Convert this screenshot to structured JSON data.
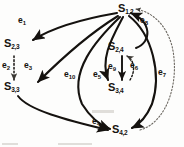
{
  "figure": {
    "type": "directed-graph",
    "caption": "",
    "width": 184,
    "height": 147,
    "background_color": "#fdfdfc",
    "ink_color": "#15120f"
  },
  "nodes": [
    {
      "id": "S12",
      "base": "S",
      "subscript": "1,2",
      "label": "S1,2",
      "x": 122,
      "y": 9
    },
    {
      "id": "S23",
      "base": "S",
      "subscript": "2,3",
      "label": "S2,3",
      "x": 6,
      "y": 44
    },
    {
      "id": "S33",
      "base": "S",
      "subscript": "3,3",
      "label": "S3,3",
      "x": 6,
      "y": 87
    },
    {
      "id": "S24",
      "base": "S",
      "subscript": "2,4",
      "label": "S2,4",
      "x": 110,
      "y": 46
    },
    {
      "id": "S34",
      "base": "S",
      "subscript": "3,4",
      "label": "S3,4",
      "x": 110,
      "y": 88
    },
    {
      "id": "S42",
      "base": "S",
      "subscript": "4,2",
      "label": "S4,2",
      "x": 114,
      "y": 125
    }
  ],
  "edges": [
    {
      "id": "e1",
      "base": "e",
      "subscript": "1",
      "label": "e1",
      "from": "S12",
      "to": "S23",
      "style": "solid",
      "label_x": 20,
      "label_y": 22
    },
    {
      "id": "e2",
      "base": "e",
      "subscript": "2",
      "label": "e2",
      "from": "S23",
      "to": "S33",
      "style": "dotted",
      "label_x": 3,
      "label_y": 65
    },
    {
      "id": "e3",
      "base": "e",
      "subscript": "3",
      "label": "e3",
      "from": "S12",
      "to": "S33",
      "style": "solid",
      "label_x": 25,
      "label_y": 64
    },
    {
      "id": "e4",
      "base": "e",
      "subscript": "4",
      "label": "e4",
      "from": "S33",
      "to": "S42",
      "style": "solid",
      "label_x": 93,
      "label_y": 121
    },
    {
      "id": "e5",
      "base": "e",
      "subscript": "5",
      "label": "e5",
      "from": "S12",
      "to": "S34",
      "style": "solid",
      "label_x": 94,
      "label_y": 74
    },
    {
      "id": "e6",
      "base": "e",
      "subscript": "6",
      "label": "e6",
      "from": "S34",
      "to": "S24",
      "style": "dotted",
      "label_x": 131,
      "label_y": 65
    },
    {
      "id": "e7",
      "base": "e",
      "subscript": "7",
      "label": "e7",
      "from": "S12",
      "to": "S42",
      "style": "solid",
      "label_x": 159,
      "label_y": 72
    },
    {
      "id": "e8",
      "base": "e",
      "subscript": "8",
      "label": "e8",
      "from": "S24",
      "to": "S12",
      "style": "solid",
      "label_x": 141,
      "label_y": 20
    },
    {
      "id": "e9",
      "base": "e",
      "subscript": "9",
      "label": "e9",
      "from": "S24",
      "to": "S34",
      "style": "solid",
      "label_x": 110,
      "label_y": 66
    },
    {
      "id": "e10",
      "base": "e",
      "subscript": "10",
      "label": "e10",
      "from": "S12",
      "to": "S42",
      "style": "solid",
      "label_x": 66,
      "label_y": 74
    }
  ],
  "extra_paths": [
    {
      "id": "return-arc",
      "from": "S42",
      "to": "S12",
      "style": "dotted"
    }
  ]
}
